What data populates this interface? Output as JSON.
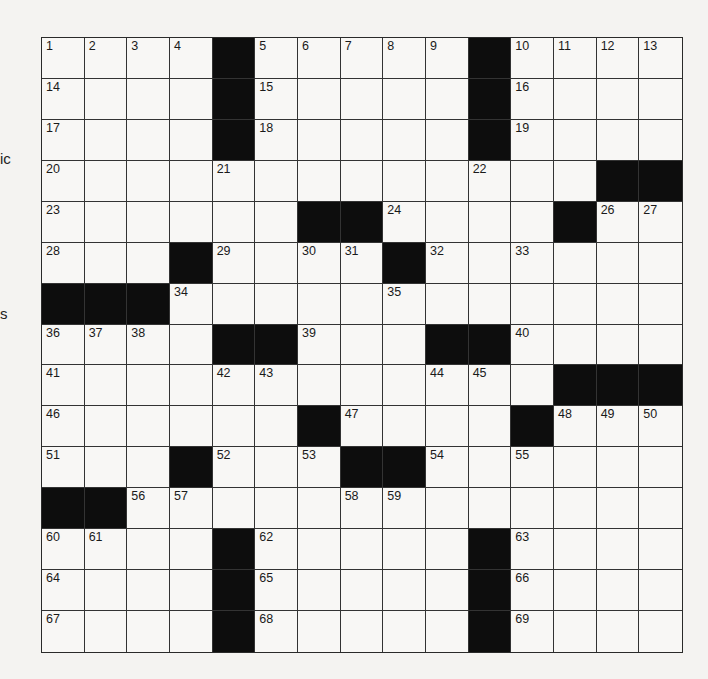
{
  "edge_fragments": [
    {
      "text": "ic",
      "x": 0,
      "y": 150
    },
    {
      "text": "s",
      "x": 0,
      "y": 305
    }
  ],
  "puzzle": {
    "rows": 15,
    "cols": 15,
    "grid": [
      "....#.....#....",
      "....#.....#....",
      "....#.....#....",
      ".............##",
      "......##....#..",
      "...#....#......",
      "###............",
      "....##...##....",
      "............###",
      "......#....#...",
      "...#...##......",
      "##.............",
      "....#.....#....",
      "....#.....#....",
      "....#.....#...."
    ],
    "numbers": [
      {
        "row": 0,
        "col": 0,
        "n": 1
      },
      {
        "row": 0,
        "col": 1,
        "n": 2
      },
      {
        "row": 0,
        "col": 2,
        "n": 3
      },
      {
        "row": 0,
        "col": 3,
        "n": 4
      },
      {
        "row": 0,
        "col": 5,
        "n": 5
      },
      {
        "row": 0,
        "col": 6,
        "n": 6
      },
      {
        "row": 0,
        "col": 7,
        "n": 7
      },
      {
        "row": 0,
        "col": 8,
        "n": 8
      },
      {
        "row": 0,
        "col": 9,
        "n": 9
      },
      {
        "row": 0,
        "col": 11,
        "n": 10
      },
      {
        "row": 0,
        "col": 12,
        "n": 11
      },
      {
        "row": 0,
        "col": 13,
        "n": 12
      },
      {
        "row": 0,
        "col": 14,
        "n": 13
      },
      {
        "row": 1,
        "col": 0,
        "n": 14
      },
      {
        "row": 1,
        "col": 5,
        "n": 15
      },
      {
        "row": 1,
        "col": 11,
        "n": 16
      },
      {
        "row": 2,
        "col": 0,
        "n": 17
      },
      {
        "row": 2,
        "col": 5,
        "n": 18
      },
      {
        "row": 2,
        "col": 11,
        "n": 19
      },
      {
        "row": 3,
        "col": 0,
        "n": 20
      },
      {
        "row": 3,
        "col": 4,
        "n": 21
      },
      {
        "row": 3,
        "col": 10,
        "n": 22
      },
      {
        "row": 4,
        "col": 0,
        "n": 23
      },
      {
        "row": 4,
        "col": 8,
        "n": 24
      },
      {
        "row": 4,
        "col": 12,
        "n": 25
      },
      {
        "row": 4,
        "col": 13,
        "n": 26
      },
      {
        "row": 4,
        "col": 14,
        "n": 27
      },
      {
        "row": 5,
        "col": 0,
        "n": 28
      },
      {
        "row": 5,
        "col": 4,
        "n": 29
      },
      {
        "row": 5,
        "col": 6,
        "n": 30
      },
      {
        "row": 5,
        "col": 7,
        "n": 31
      },
      {
        "row": 5,
        "col": 9,
        "n": 32
      },
      {
        "row": 5,
        "col": 11,
        "n": 33
      },
      {
        "row": 6,
        "col": 3,
        "n": 34
      },
      {
        "row": 6,
        "col": 8,
        "n": 35
      },
      {
        "row": 7,
        "col": 0,
        "n": 36
      },
      {
        "row": 7,
        "col": 1,
        "n": 37
      },
      {
        "row": 7,
        "col": 2,
        "n": 38
      },
      {
        "row": 7,
        "col": 6,
        "n": 39
      },
      {
        "row": 7,
        "col": 11,
        "n": 40
      },
      {
        "row": 8,
        "col": 0,
        "n": 41
      },
      {
        "row": 8,
        "col": 4,
        "n": 42
      },
      {
        "row": 8,
        "col": 5,
        "n": 43
      },
      {
        "row": 8,
        "col": 9,
        "n": 44
      },
      {
        "row": 8,
        "col": 10,
        "n": 45
      },
      {
        "row": 9,
        "col": 0,
        "n": 46
      },
      {
        "row": 9,
        "col": 7,
        "n": 47
      },
      {
        "row": 9,
        "col": 12,
        "n": 48
      },
      {
        "row": 9,
        "col": 13,
        "n": 49
      },
      {
        "row": 9,
        "col": 14,
        "n": 50
      },
      {
        "row": 10,
        "col": 0,
        "n": 51
      },
      {
        "row": 10,
        "col": 4,
        "n": 52
      },
      {
        "row": 10,
        "col": 6,
        "n": 53
      },
      {
        "row": 10,
        "col": 9,
        "n": 54
      },
      {
        "row": 10,
        "col": 11,
        "n": 55
      },
      {
        "row": 11,
        "col": 2,
        "n": 56
      },
      {
        "row": 11,
        "col": 3,
        "n": 57
      },
      {
        "row": 11,
        "col": 7,
        "n": 58
      },
      {
        "row": 11,
        "col": 8,
        "n": 59
      },
      {
        "row": 12,
        "col": 0,
        "n": 60
      },
      {
        "row": 12,
        "col": 1,
        "n": 61
      },
      {
        "row": 12,
        "col": 5,
        "n": 62
      },
      {
        "row": 12,
        "col": 11,
        "n": 63
      },
      {
        "row": 13,
        "col": 0,
        "n": 64
      },
      {
        "row": 13,
        "col": 5,
        "n": 65
      },
      {
        "row": 13,
        "col": 11,
        "n": 66
      },
      {
        "row": 14,
        "col": 0,
        "n": 67
      },
      {
        "row": 14,
        "col": 5,
        "n": 68
      },
      {
        "row": 14,
        "col": 11,
        "n": 69
      }
    ]
  },
  "colors": {
    "background": "#f4f3f1",
    "cell": "#f8f7f5",
    "black_square": "#0d0d0d",
    "grid_line": "#333333"
  }
}
